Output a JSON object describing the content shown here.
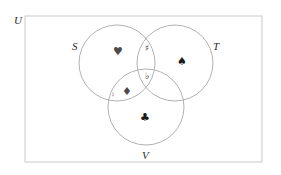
{
  "figure": {
    "universe": {
      "label": "U",
      "label_x": 14,
      "label_y": 24,
      "x": 25,
      "y": 16,
      "width": 237,
      "height": 146,
      "stroke": "#c9c9c9",
      "fill": "#ffffff"
    },
    "circles": [
      {
        "name": "S",
        "label": "S",
        "label_x": 72,
        "label_y": 50,
        "cx": 117,
        "cy": 63,
        "r": 38,
        "stroke": "#a8a8a8"
      },
      {
        "name": "T",
        "label": "T",
        "label_x": 213,
        "label_y": 50,
        "cx": 175,
        "cy": 63,
        "r": 38,
        "stroke": "#a8a8a8"
      },
      {
        "name": "V",
        "label": "V",
        "label_x": 142,
        "label_y": 159,
        "cx": 146,
        "cy": 107,
        "r": 38,
        "stroke": "#a8a8a8"
      }
    ],
    "elements": [
      {
        "id": "heart",
        "icon": "heart-suit-icon",
        "glyph": "♥",
        "region": "S only",
        "x": 118,
        "y": 52,
        "style": "glyph-suit-muted"
      },
      {
        "id": "sharp",
        "icon": "music-sharp-icon",
        "glyph": "♯",
        "region": "S and T",
        "x": 147,
        "y": 48,
        "style": "glyph-music"
      },
      {
        "id": "spade",
        "icon": "spade-suit-icon",
        "glyph": "♠",
        "region": "T only",
        "x": 182,
        "y": 62,
        "style": "glyph-suit"
      },
      {
        "id": "flat",
        "icon": "music-flat-icon",
        "glyph": "♭",
        "region": "S and T and V",
        "x": 147,
        "y": 76,
        "style": "glyph-music"
      },
      {
        "id": "diamond",
        "icon": "diamond-suit-icon",
        "glyph": "♦",
        "region": "S and V",
        "x": 127,
        "y": 92,
        "style": "glyph-suit-muted"
      },
      {
        "id": "natural",
        "icon": "music-natural-icon",
        "glyph": "♮",
        "region": "S and V",
        "x": 113,
        "y": 95,
        "style": "glyph-music-small"
      },
      {
        "id": "club",
        "icon": "club-suit-icon",
        "glyph": "♣",
        "region": "V only",
        "x": 145,
        "y": 118,
        "style": "glyph-suit"
      }
    ]
  }
}
